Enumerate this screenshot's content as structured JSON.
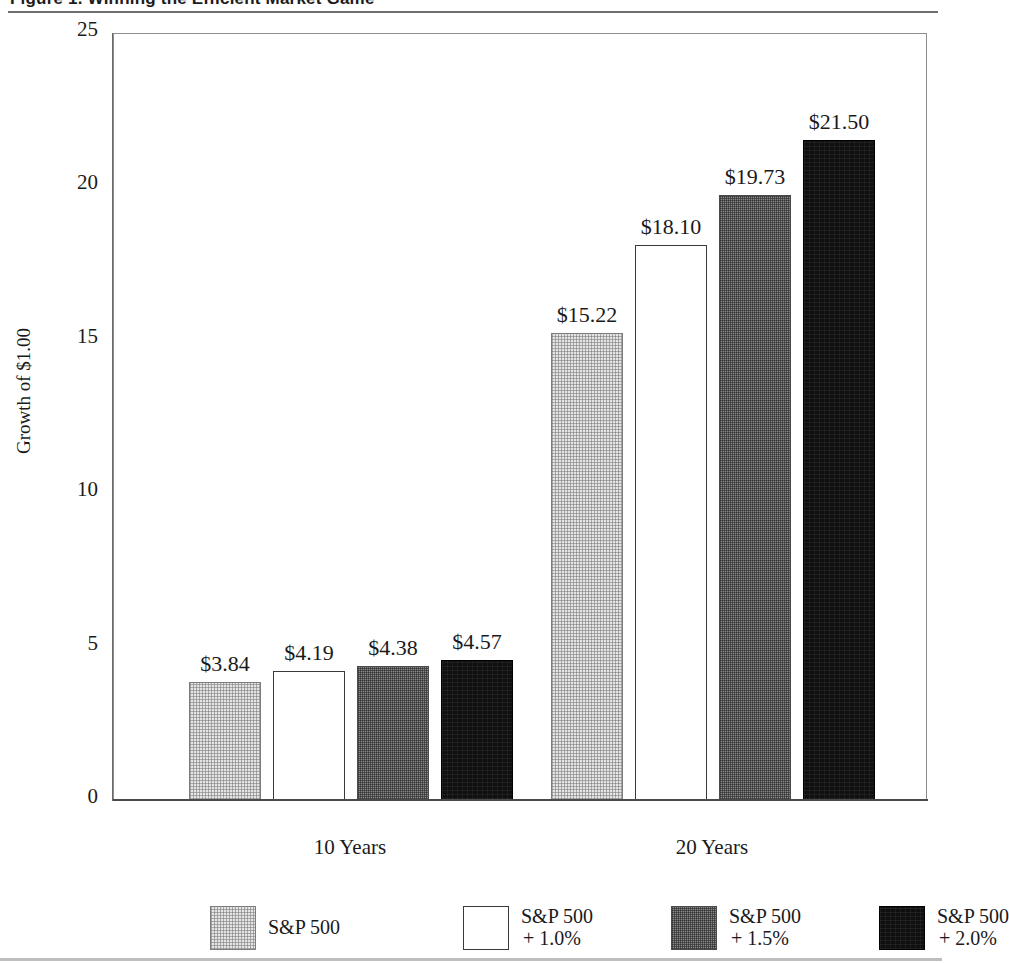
{
  "figure": {
    "title": "Figure 1.  Winning the Efficient Market Game",
    "title_rule_color": "#6e6e6e"
  },
  "chart_data": {
    "type": "bar",
    "title": "Figure 1.  Winning the Efficient Market Game",
    "xlabel": "",
    "ylabel": "Growth of $1.00",
    "categories": [
      "10 Years",
      "20 Years"
    ],
    "ylim": [
      0,
      25
    ],
    "yticks": [
      0,
      5,
      10,
      15,
      20,
      25
    ],
    "ytick_labels": [
      "0",
      "5",
      "10",
      "15",
      "20",
      "25"
    ],
    "grid": false,
    "legend_position": "bottom",
    "series": [
      {
        "name": "S&P 500",
        "legend_line1": "S&P 500",
        "legend_line2": "",
        "swatch": "swatch-light",
        "color": "#e4e4e4",
        "values": [
          3.84,
          4.19
        ],
        "labels": [
          "$3.84",
          "$15.22"
        ]
      },
      {
        "name": "S&P 500 + 1.0%",
        "legend_line1": "S&P 500",
        "legend_line2": "+ 1.0%",
        "swatch": "swatch-white",
        "color": "#ffffff",
        "values": [
          4.19,
          18.1
        ],
        "labels": [
          "$4.19",
          "$18.10"
        ]
      },
      {
        "name": "S&P 500 + 1.5%",
        "legend_line1": "S&P 500",
        "legend_line2": "+ 1.5%",
        "swatch": "swatch-gray",
        "color": "#8a8a8a",
        "values": [
          4.38,
          19.73
        ],
        "labels": [
          "$4.38",
          "$19.73"
        ]
      },
      {
        "name": "S&P 500 + 2.0%",
        "legend_line1": "S&P 500",
        "legend_line2": "+ 2.0%",
        "swatch": "swatch-black",
        "color": "#101010",
        "values": [
          4.57,
          21.5
        ],
        "labels": [
          "$4.57",
          "$21.50"
        ]
      }
    ],
    "bars": [
      {
        "group": "10 Years",
        "series": "S&P 500",
        "value": 3.84,
        "label": "$3.84",
        "swatch": "swatch-light"
      },
      {
        "group": "10 Years",
        "series": "S&P 500 + 1.0%",
        "value": 4.19,
        "label": "$4.19",
        "swatch": "swatch-white"
      },
      {
        "group": "10 Years",
        "series": "S&P 500 + 1.5%",
        "value": 4.38,
        "label": "$4.38",
        "swatch": "swatch-gray"
      },
      {
        "group": "10 Years",
        "series": "S&P 500 + 2.0%",
        "value": 4.57,
        "label": "$4.57",
        "swatch": "swatch-black"
      },
      {
        "group": "20 Years",
        "series": "S&P 500",
        "value": 15.22,
        "label": "$15.22",
        "swatch": "swatch-light"
      },
      {
        "group": "20 Years",
        "series": "S&P 500 + 1.0%",
        "value": 18.1,
        "label": "$18.10",
        "swatch": "swatch-white"
      },
      {
        "group": "20 Years",
        "series": "S&P 500 + 1.5%",
        "value": 19.73,
        "label": "$19.73",
        "swatch": "swatch-gray"
      },
      {
        "group": "20 Years",
        "series": "S&P 500 + 2.0%",
        "value": 21.5,
        "label": "$21.50",
        "swatch": "swatch-black"
      }
    ]
  },
  "axis": {
    "y_title": "Growth of $1.00",
    "y_labels": [
      "25",
      "20",
      "15",
      "10",
      "5",
      "0"
    ],
    "x_labels": [
      "10 Years",
      "20 Years"
    ]
  },
  "legend": {
    "items": [
      {
        "line1": "S&P 500",
        "line2": "",
        "swatch": "swatch-light"
      },
      {
        "line1": "S&P 500",
        "line2": "+ 1.0%",
        "swatch": "swatch-white"
      },
      {
        "line1": "S&P 500",
        "line2": "+ 1.5%",
        "swatch": "swatch-gray"
      },
      {
        "line1": "S&P 500",
        "line2": "+ 2.0%",
        "swatch": "swatch-black"
      }
    ]
  }
}
